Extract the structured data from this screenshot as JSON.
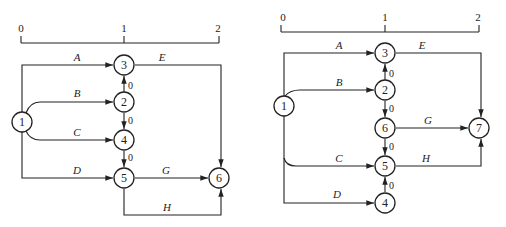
{
  "diagrams": [
    {
      "name": "network-left",
      "axis": {
        "ticks": [
          "0",
          "1",
          "2"
        ]
      },
      "nodes": [
        "1",
        "2",
        "3",
        "4",
        "5",
        "6"
      ],
      "activities": [
        {
          "label": "A",
          "from": "1",
          "to": "3"
        },
        {
          "label": "B",
          "from": "1",
          "to": "2"
        },
        {
          "label": "C",
          "from": "1",
          "to": "4"
        },
        {
          "label": "D",
          "from": "1",
          "to": "5"
        },
        {
          "label": "E",
          "from": "3",
          "to": "6"
        },
        {
          "label": "G",
          "from": "5",
          "to": "6"
        },
        {
          "label": "H",
          "from": "5",
          "to": "6"
        }
      ],
      "dummies": [
        {
          "from": "2",
          "to": "3",
          "label": "0"
        },
        {
          "from": "2",
          "to": "4",
          "label": "0"
        },
        {
          "from": "4",
          "to": "5",
          "label": "0"
        }
      ]
    },
    {
      "name": "network-right",
      "axis": {
        "ticks": [
          "0",
          "1",
          "2"
        ]
      },
      "nodes": [
        "1",
        "2",
        "3",
        "4",
        "5",
        "6",
        "7"
      ],
      "activities": [
        {
          "label": "A",
          "from": "1",
          "to": "3"
        },
        {
          "label": "B",
          "from": "1",
          "to": "2"
        },
        {
          "label": "C",
          "from": "1",
          "to": "5"
        },
        {
          "label": "D",
          "from": "1",
          "to": "4"
        },
        {
          "label": "E",
          "from": "3",
          "to": "7"
        },
        {
          "label": "G",
          "from": "6",
          "to": "7"
        },
        {
          "label": "H",
          "from": "5",
          "to": "7"
        }
      ],
      "dummies": [
        {
          "from": "2",
          "to": "3",
          "label": "0"
        },
        {
          "from": "2",
          "to": "6",
          "label": "0"
        },
        {
          "from": "6",
          "to": "5",
          "label": "0"
        },
        {
          "from": "4",
          "to": "5",
          "label": "0"
        }
      ]
    }
  ]
}
